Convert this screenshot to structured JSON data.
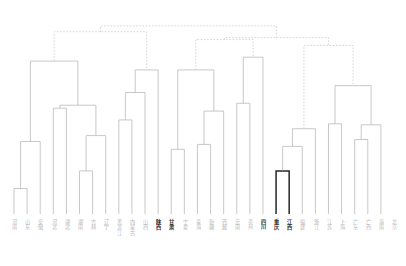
{
  "figure": {
    "type": "dendrogram",
    "title": "",
    "orientation": "top-down",
    "background_color": "#ffffff",
    "link_color_normal": "#b0b0b0",
    "link_color_highlight": "#262626",
    "link_color_above_threshold": "#c4c4c4",
    "above_threshold_style": "dashed",
    "label_color_normal": "#b9b9b9",
    "label_color_highlight": "#2b2b2b"
  },
  "chart_data": {
    "type": "dendrogram",
    "title": "",
    "xlabel": "",
    "ylabel": "",
    "n_leaves": 30,
    "leaf_labels": [
      "河南",
      "山东",
      "安徽",
      "河北",
      "湖北",
      "湖南",
      "吉林",
      "辽宁",
      "黑龙江",
      "内蒙古",
      "山西",
      "陕西",
      "甘肃",
      "宁夏",
      "青海",
      "新疆",
      "西藏",
      "云南",
      "贵州",
      "四川",
      "重庆",
      "江西",
      "福建",
      "浙江",
      "江苏",
      "上海",
      "广东",
      "广西",
      "海南",
      "北京"
    ],
    "highlighted_leaf_indices": [
      11,
      12,
      19,
      20,
      21
    ],
    "highlighted_cluster_count": 2,
    "cluster_count_below_threshold": 4,
    "merges": [
      {
        "id": 30,
        "left": 0,
        "right": 1,
        "height": 0.13
      },
      {
        "id": 31,
        "left": 30,
        "right": 2,
        "height": 0.37
      },
      {
        "id": 32,
        "left": 3,
        "right": 4,
        "height": 0.54
      },
      {
        "id": 33,
        "left": 5,
        "right": 6,
        "height": 0.22
      },
      {
        "id": 34,
        "left": 33,
        "right": 7,
        "height": 0.4
      },
      {
        "id": 35,
        "left": 32,
        "right": 34,
        "height": 0.555
      },
      {
        "id": 36,
        "left": 31,
        "right": 35,
        "height": 0.78
      },
      {
        "id": 37,
        "left": 8,
        "right": 9,
        "height": 0.48
      },
      {
        "id": 38,
        "left": 37,
        "right": 10,
        "height": 0.62
      },
      {
        "id": 39,
        "left": 38,
        "right": 11,
        "height": 0.735
      },
      {
        "id": 40,
        "left": 12,
        "right": 13,
        "height": 0.33
      },
      {
        "id": 41,
        "left": 14,
        "right": 15,
        "height": 0.355
      },
      {
        "id": 42,
        "left": 41,
        "right": 16,
        "height": 0.525
      },
      {
        "id": 43,
        "left": 40,
        "right": 42,
        "height": 0.735
      },
      {
        "id": 44,
        "left": 17,
        "right": 18,
        "height": 0.565
      },
      {
        "id": 45,
        "left": 44,
        "right": 19,
        "height": 0.8
      },
      {
        "id": 46,
        "left": 20,
        "right": 21,
        "height": 0.22
      },
      {
        "id": 47,
        "left": 46,
        "right": 22,
        "height": 0.345
      },
      {
        "id": 48,
        "left": 47,
        "right": 23,
        "height": 0.435
      },
      {
        "id": 49,
        "left": 24,
        "right": 25,
        "height": 0.46
      },
      {
        "id": 50,
        "left": 26,
        "right": 27,
        "height": 0.38
      },
      {
        "id": 51,
        "left": 50,
        "right": 28,
        "height": 0.455
      },
      {
        "id": 52,
        "left": 49,
        "right": 51,
        "height": 0.655
      },
      {
        "id": 53,
        "left": 36,
        "right": 39,
        "height": 0.93
      },
      {
        "id": 54,
        "left": 43,
        "right": 45,
        "height": 0.89
      },
      {
        "id": 55,
        "left": 48,
        "right": 52,
        "height": 0.86
      },
      {
        "id": 56,
        "left": 54,
        "right": 55,
        "height": 0.9
      },
      {
        "id": 57,
        "left": 53,
        "right": 56,
        "height": 0.96
      }
    ],
    "ylim": [
      0,
      1
    ],
    "grid": false,
    "legend": "none"
  }
}
